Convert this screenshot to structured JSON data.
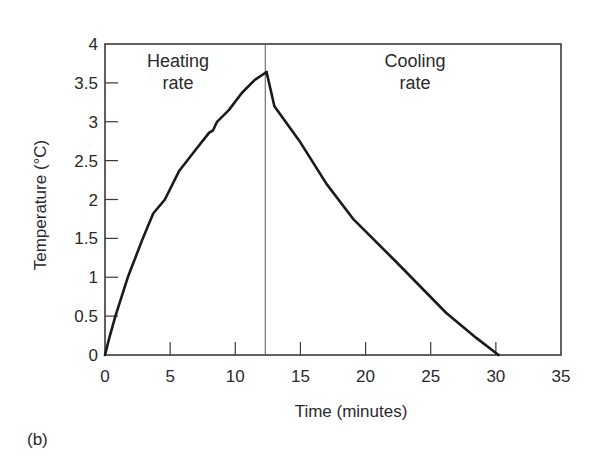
{
  "panel_label": "(b)",
  "chart_data": {
    "type": "line",
    "title": "",
    "xlabel": "Time (minutes)",
    "ylabel": "Temperature (°C)",
    "xlim": [
      0,
      35
    ],
    "ylim": [
      0,
      4
    ],
    "xticks": [
      0,
      5,
      10,
      15,
      20,
      25,
      30,
      35
    ],
    "yticks": [
      0,
      0.5,
      1,
      1.5,
      2,
      2.5,
      3,
      3.5,
      4
    ],
    "xtick_labels": [
      "0",
      "5",
      "10",
      "15",
      "20",
      "25",
      "30",
      "35"
    ],
    "ytick_labels": [
      "0",
      "0.5",
      "1",
      "1.5",
      "2",
      "2.5",
      "3",
      "3.5",
      "4"
    ],
    "grid": false,
    "legend": null,
    "vertical_line_x": 12.3,
    "annotations": [
      {
        "text_lines": [
          "Heating",
          "rate"
        ],
        "x": 5.6,
        "y": 3.7
      },
      {
        "text_lines": [
          "Cooling",
          "rate"
        ],
        "x": 23.8,
        "y": 3.7
      }
    ],
    "series": [
      {
        "name": "Heating",
        "color": "#1a1a1a",
        "x": [
          0,
          0.3,
          0.8,
          1.75,
          2.9,
          3.7,
          4.6,
          5.7,
          7.0,
          8.0,
          8.3,
          8.6,
          9.5,
          10.5,
          11.5,
          12.4
        ],
        "y": [
          0,
          0.2,
          0.5,
          1.0,
          1.5,
          1.82,
          2.0,
          2.37,
          2.65,
          2.86,
          2.89,
          3.0,
          3.15,
          3.37,
          3.54,
          3.64
        ]
      },
      {
        "name": "Cooling",
        "color": "#1a1a1a",
        "x": [
          12.4,
          13.0,
          14.9,
          17.0,
          19.1,
          22.4,
          26.2,
          28.5,
          30.2
        ],
        "y": [
          3.64,
          3.2,
          2.76,
          2.2,
          1.74,
          1.19,
          0.54,
          0.22,
          0.0
        ]
      }
    ]
  }
}
